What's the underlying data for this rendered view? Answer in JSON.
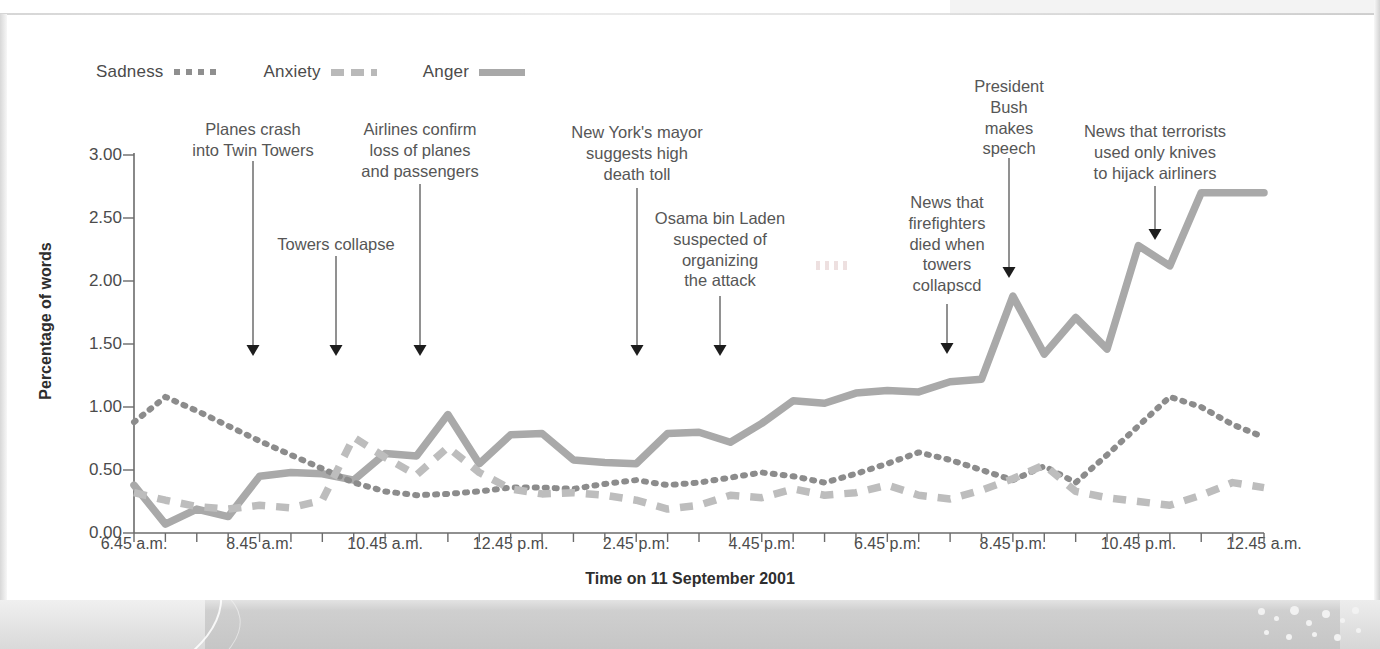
{
  "chart_data": {
    "type": "line",
    "title": "",
    "xlabel": "Time on 11 September 2001",
    "ylabel": "Percentage of words",
    "ylim": [
      0.0,
      3.0
    ],
    "yticks": [
      "0.00",
      "0.50",
      "1.00",
      "1.50",
      "2.00",
      "2.50",
      "3.00"
    ],
    "ytick_values": [
      0.0,
      0.5,
      1.0,
      1.5,
      2.0,
      2.5,
      3.0
    ],
    "grid": false,
    "legend_position": "top-left",
    "x_axis_note": "Ticks every 30 minutes from 6.45 a.m. to 12.45 a.m.; labels every 2 hours",
    "xtick_labels": [
      "6.45 a.m.",
      "8.45 a.m.",
      "10.45 a.m.",
      "12.45 p.m.",
      "2.45 p.m.",
      "4.45 p.m.",
      "6.45 p.m.",
      "8.45 p.m.",
      "10.45 p.m.",
      "12.45 a.m."
    ],
    "x": [
      "6.45 a.m.",
      "7.15 a.m.",
      "7.45 a.m.",
      "8.15 a.m.",
      "8.45 a.m.",
      "9.15 a.m.",
      "9.45 a.m.",
      "10.15 a.m.",
      "10.45 a.m.",
      "11.15 a.m.",
      "11.45 a.m.",
      "12.15 p.m.",
      "12.45 p.m.",
      "1.15 p.m.",
      "1.45 p.m.",
      "2.15 p.m.",
      "2.45 p.m.",
      "3.15 p.m.",
      "3.45 p.m.",
      "4.15 p.m.",
      "4.45 p.m.",
      "5.15 p.m.",
      "5.45 p.m.",
      "6.15 p.m.",
      "6.45 p.m.",
      "7.15 p.m.",
      "7.45 p.m.",
      "8.15 p.m.",
      "8.45 p.m.",
      "9.15 p.m.",
      "9.45 p.m.",
      "10.15 p.m.",
      "10.45 p.m.",
      "11.15 p.m.",
      "11.45 p.m.",
      "12.15 a.m.",
      "12.45 a.m."
    ],
    "series": [
      {
        "name": "Sadness",
        "style": "dotted",
        "color": "#8c8c8c",
        "values": [
          0.88,
          1.08,
          0.97,
          0.85,
          0.73,
          0.62,
          0.51,
          0.4,
          0.33,
          0.3,
          0.31,
          0.33,
          0.36,
          0.36,
          0.35,
          0.39,
          0.42,
          0.38,
          0.4,
          0.44,
          0.48,
          0.45,
          0.4,
          0.47,
          0.55,
          0.64,
          0.58,
          0.5,
          0.42,
          0.53,
          0.4,
          0.62,
          0.85,
          1.08,
          1.0,
          0.86,
          0.76
        ]
      },
      {
        "name": "Anxiety",
        "style": "dashed",
        "color": "#bdbdbd",
        "values": [
          0.32,
          0.26,
          0.21,
          0.19,
          0.22,
          0.2,
          0.26,
          0.76,
          0.6,
          0.46,
          0.68,
          0.48,
          0.35,
          0.31,
          0.32,
          0.3,
          0.26,
          0.19,
          0.22,
          0.3,
          0.28,
          0.35,
          0.3,
          0.32,
          0.38,
          0.3,
          0.27,
          0.34,
          0.43,
          0.54,
          0.33,
          0.28,
          0.25,
          0.22,
          0.3,
          0.4,
          0.36
        ]
      },
      {
        "name": "Anger",
        "style": "solid",
        "color": "#a9a9a9",
        "values": [
          0.38,
          0.07,
          0.19,
          0.13,
          0.45,
          0.48,
          0.47,
          0.42,
          0.63,
          0.61,
          0.94,
          0.55,
          0.78,
          0.79,
          0.58,
          0.56,
          0.55,
          0.79,
          0.8,
          0.72,
          0.87,
          1.05,
          1.03,
          1.11,
          1.13,
          1.12,
          1.2,
          1.22,
          1.88,
          1.42,
          1.71,
          1.46,
          2.28,
          2.12,
          2.7,
          2.7,
          2.7
        ]
      }
    ],
    "annotations": [
      {
        "text": "Planes crash\ninto Twin Towers",
        "x_time": "8.45 a.m.",
        "label_x": 253,
        "label_top": 103,
        "arrow_top": 145,
        "arrow_tip": 340
      },
      {
        "text": "Towers collapse",
        "x_time": "9.45 a.m.",
        "label_x": 336,
        "label_top": 218,
        "arrow_top": 240,
        "arrow_tip": 340
      },
      {
        "text": "Airlines confirm\nloss of planes\nand passengers",
        "x_time": "10.45 a.m.",
        "label_x": 420,
        "label_top": 103,
        "arrow_top": 168,
        "arrow_tip": 340
      },
      {
        "text": "New York's mayor\nsuggests high\ndeath toll",
        "x_time": "2.45 p.m.",
        "label_x": 637,
        "label_top": 106,
        "arrow_top": 172,
        "arrow_tip": 340
      },
      {
        "text": "Osama bin Laden\nsuspected of\norganizing\nthe attack",
        "x_time": "3.45 p.m.",
        "label_x": 720,
        "label_top": 192,
        "arrow_top": 280,
        "arrow_tip": 340
      },
      {
        "text": "News that\nfirefighters\ndied when\ntowers\ncollapscd",
        "x_time": "7.45 p.m.",
        "label_x": 947,
        "label_top": 176,
        "arrow_top": 288,
        "arrow_tip": 338
      },
      {
        "text": "President\nBush\nmakes\nspeech",
        "x_time": "8.45 p.m.",
        "label_x": 1009,
        "label_top": 60,
        "arrow_top": 142,
        "arrow_tip": 262
      },
      {
        "text": "News that terrorists\nused only knives\nto hijack airliners",
        "x_time": "10.45 p.m.",
        "label_x": 1155,
        "label_top": 105,
        "arrow_top": 170,
        "arrow_tip": 224
      }
    ]
  },
  "legend": {
    "items": [
      {
        "label": "Sadness",
        "key": "dotted-key-icon"
      },
      {
        "label": "Anxiety",
        "key": "dashed-key-icon"
      },
      {
        "label": "Anger",
        "key": "solid-key-icon"
      }
    ]
  },
  "axis": {
    "y_title": "Percentage of words",
    "x_title": "Time on 11 September 2001"
  },
  "colors": {
    "sadness": "#8c8c8c",
    "anxiety": "#bdbdbd",
    "anger": "#a9a9a9",
    "axis": "#6b6b6b",
    "text": "#4b4b4b",
    "title": "#2e2e2e",
    "arrow": "#1d1d1d"
  }
}
